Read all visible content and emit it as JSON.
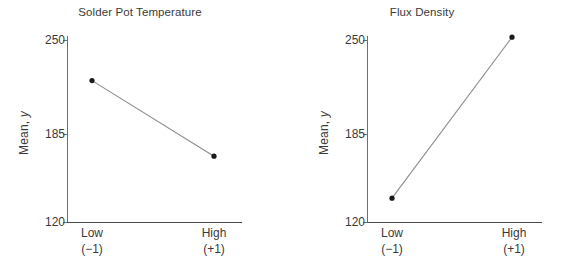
{
  "figure": {
    "background": "#ffffff",
    "line_color": "#8c8c8c",
    "marker_color": "#1a1a1a",
    "axis_color": "#6d6e70",
    "text_color": "#3a3a3a"
  },
  "chart_data": [
    {
      "type": "line",
      "title": "Solder Pot Temperature",
      "xlabel": "",
      "ylabel": "Mean, y",
      "categories": [
        "Low",
        "High"
      ],
      "category_codes": [
        "(−1)",
        "(+1)"
      ],
      "values": [
        221,
        167
      ],
      "ylim": [
        120,
        250
      ],
      "yticks": [
        120,
        185,
        250
      ],
      "ytick_labels": [
        "120",
        "185",
        "250"
      ],
      "grid": false,
      "legend": "none"
    },
    {
      "type": "line",
      "title": "Flux Density",
      "xlabel": "",
      "ylabel": "Mean, y",
      "categories": [
        "Low",
        "High"
      ],
      "category_codes": [
        "(−1)",
        "(+1)"
      ],
      "values": [
        137,
        252
      ],
      "ylim": [
        120,
        250
      ],
      "yticks": [
        120,
        185,
        250
      ],
      "ytick_labels": [
        "120",
        "185",
        "250"
      ],
      "grid": false,
      "legend": "none"
    }
  ],
  "panels": [
    {
      "title": "Solder Pot Temperature",
      "ylabel_prefix": "Mean, ",
      "ylabel_italic": "y",
      "yticks": [
        "250",
        "185",
        "120"
      ],
      "xticks": [
        {
          "label": "Low",
          "code": "(−1)"
        },
        {
          "label": "High",
          "code": "(+1)"
        }
      ]
    },
    {
      "title": "Flux Density",
      "ylabel_prefix": "Mean, ",
      "ylabel_italic": "y",
      "yticks": [
        "250",
        "185",
        "120"
      ],
      "xticks": [
        {
          "label": "Low",
          "code": "(−1)"
        },
        {
          "label": "High",
          "code": "(+1)"
        }
      ]
    }
  ]
}
